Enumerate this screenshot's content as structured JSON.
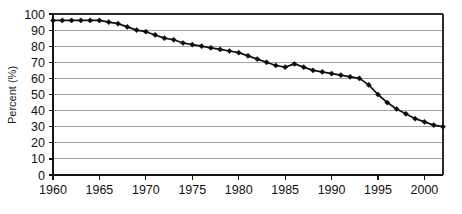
{
  "chart_data": {
    "type": "line",
    "title": "",
    "subtitle": "",
    "xlabel": "",
    "ylabel": "Percent (%)",
    "xlim": [
      1960,
      2002
    ],
    "ylim": [
      0,
      100
    ],
    "ytick_step": 10,
    "xtick_step": 5,
    "grid": "horizontal",
    "legend": "none",
    "marker": "diamond",
    "line_color": "#111111",
    "grid_color": "#9a9a9a",
    "yticks": [
      0,
      10,
      20,
      30,
      40,
      50,
      60,
      70,
      80,
      90,
      100
    ],
    "ytick_labels": [
      "0",
      "10",
      "20",
      "30",
      "40",
      "50",
      "60",
      "70",
      "80",
      "90",
      "100"
    ],
    "xticks": [
      1960,
      1965,
      1970,
      1975,
      1980,
      1985,
      1990,
      1995,
      2000
    ],
    "xtick_labels": [
      "1960",
      "1965",
      "1970",
      "1975",
      "1980",
      "1985",
      "1990",
      "1995",
      "2000"
    ],
    "x": [
      1960,
      1961,
      1962,
      1963,
      1964,
      1965,
      1966,
      1967,
      1968,
      1969,
      1970,
      1971,
      1972,
      1973,
      1974,
      1975,
      1976,
      1977,
      1978,
      1979,
      1980,
      1981,
      1982,
      1983,
      1984,
      1985,
      1986,
      1987,
      1988,
      1989,
      1990,
      1991,
      1992,
      1993,
      1994,
      1995,
      1996,
      1997,
      1998,
      1999,
      2000,
      2001,
      2002
    ],
    "values": [
      96,
      96,
      96,
      96,
      96,
      96,
      95,
      94,
      92,
      90,
      89,
      87,
      85,
      84,
      82,
      81,
      80,
      79,
      78,
      77,
      76,
      74,
      72,
      70,
      68,
      67,
      69,
      67,
      65,
      64,
      63,
      62,
      61,
      60,
      56,
      50,
      45,
      41,
      38,
      35,
      33,
      31,
      30
    ],
    "series": [
      {
        "name": "Percent",
        "values": [
          96,
          96,
          96,
          96,
          96,
          96,
          95,
          94,
          92,
          90,
          89,
          87,
          85,
          84,
          82,
          81,
          80,
          79,
          78,
          77,
          76,
          74,
          72,
          70,
          68,
          67,
          69,
          67,
          65,
          64,
          63,
          62,
          61,
          60,
          56,
          50,
          45,
          41,
          38,
          35,
          33,
          31,
          30
        ]
      }
    ],
    "annotations": []
  }
}
